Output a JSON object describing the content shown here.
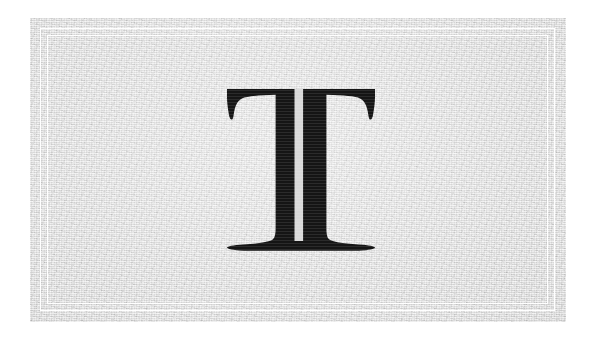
{
  "canvas": {
    "width": 596,
    "height": 340,
    "background_color": "#ffffff"
  },
  "card": {
    "name": "letter-tile",
    "x": 30,
    "y": 18,
    "width": 536,
    "height": 304,
    "background_color": "#d9d9d9",
    "texture": "paper-grain",
    "border": {
      "style": "double-rule",
      "color": "#ffffff",
      "outer_inset": 10,
      "inner_inset": 17,
      "line_width": 1.3
    }
  },
  "glyph": {
    "character": "T",
    "name": "letter-t",
    "style": "serif-didone-inline",
    "ink_color": "#151515",
    "inline_color": "#d9d9d9",
    "has_inline_stripe": true,
    "bounds": {
      "left": 227,
      "top": 89,
      "right": 375,
      "bottom": 248
    }
  },
  "alt_text": "Decorative textured grey tile with a white double-rule border framing a large black serif capital letter T with a white inline stripe through its stem"
}
